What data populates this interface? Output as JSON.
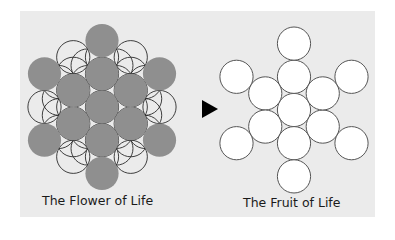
{
  "captions": {
    "flower": "The Flower of Life",
    "fruit": "The Fruit of Life"
  },
  "colors": {
    "panel_bg": "#ebebeb",
    "filled_circle": "#8f8f8f",
    "outline": "#2a2a2a",
    "fruit_fill": "#ffffff",
    "fruit_stroke": "#555555",
    "arrow": "#000000"
  },
  "geometry": {
    "radius": 16.6,
    "flower_center": [
      102,
      107
    ],
    "fruit_center": [
      294,
      110
    ],
    "arrow": [
      [
        202,
        100
      ],
      [
        218,
        109
      ],
      [
        202,
        118
      ]
    ]
  },
  "icons": {
    "arrow": "triangle-right-icon"
  }
}
